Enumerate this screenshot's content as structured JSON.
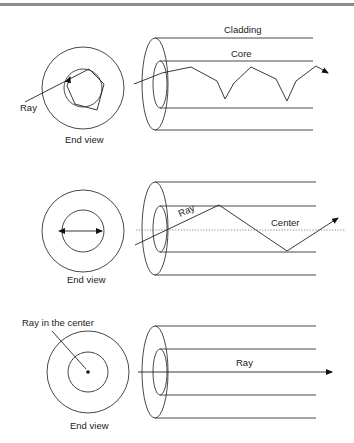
{
  "diagram": {
    "colors": {
      "line": "#333333",
      "text": "#222222",
      "top_border": "#8a8a8a"
    },
    "panels": [
      {
        "id": "multimode-skew",
        "end_view_label": "End view",
        "ray_label": "Ray",
        "cladding_label": "Cladding",
        "core_label": "Core"
      },
      {
        "id": "meridional",
        "end_view_label": "End view",
        "ray_label": "Ray",
        "center_label": "Center"
      },
      {
        "id": "axial",
        "end_view_label": "End view",
        "ray_label": "Ray",
        "center_ray_label": "Ray in the center"
      }
    ]
  }
}
